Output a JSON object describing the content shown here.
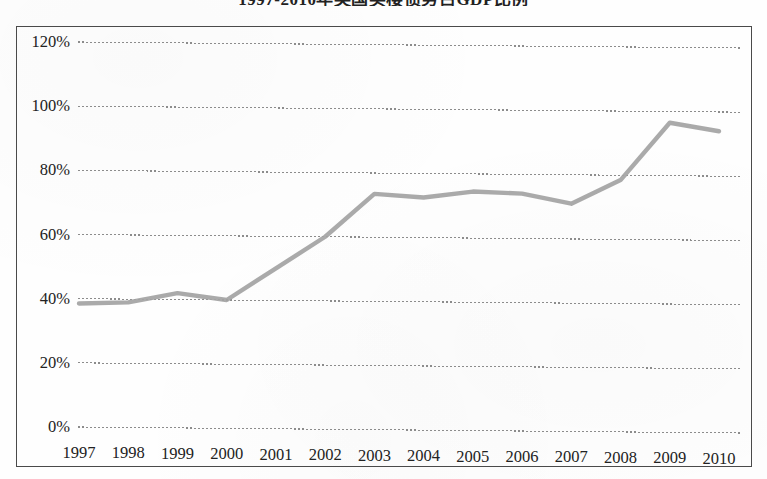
{
  "chart_data": {
    "type": "line",
    "title": "1997-2010年英国买楼债务占GDP比例",
    "xlabel": "",
    "ylabel": "",
    "categories": [
      "1997",
      "1998",
      "1999",
      "2000",
      "2001",
      "2002",
      "2003",
      "2004",
      "2005",
      "2006",
      "2007",
      "2008",
      "2009",
      "2010"
    ],
    "values": [
      38.5,
      39,
      42,
      40,
      50,
      60,
      73.5,
      72.5,
      74.5,
      74,
      71,
      78.5,
      96.5,
      94
    ],
    "value_unit": "%",
    "series": [
      {
        "name": "英国买楼债务占GDP比例",
        "values": [
          38.5,
          39,
          42,
          40,
          50,
          60,
          73.5,
          72.5,
          74.5,
          74,
          71,
          78.5,
          96.5,
          94
        ]
      }
    ],
    "ylim": [
      0,
      120
    ],
    "ytick_values": [
      0,
      20,
      40,
      60,
      80,
      100,
      120
    ],
    "ytick_labels": [
      "0%",
      "20%",
      "40%",
      "60%",
      "80%",
      "100%",
      "120%"
    ],
    "grid": true,
    "grid_style": "dotted-horizontal",
    "legend": false,
    "legend_position": "none",
    "colors": {
      "line": "#a3a3a3",
      "grid": "#8c8c8c",
      "border": "#4a4a4a",
      "text": "#222222",
      "background": "#fefefe"
    }
  }
}
